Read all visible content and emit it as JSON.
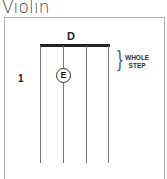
{
  "title": "Violin",
  "diagram": {
    "open_string_note": "D",
    "finger_number": "1",
    "fingered_note": "E",
    "interval_label_line1": "WHOLE",
    "interval_label_line2": "STEP",
    "string_count": 4
  }
}
